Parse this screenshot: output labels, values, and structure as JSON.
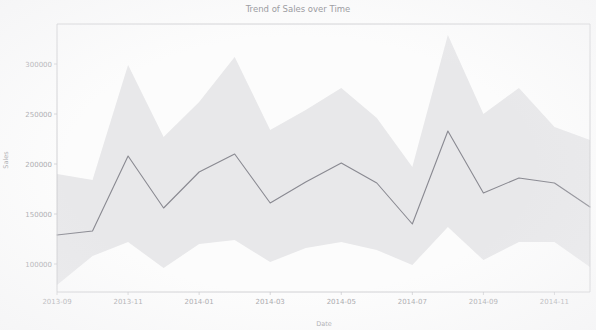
{
  "chart_data": {
    "type": "line",
    "title": "Trend of Sales over Time",
    "xlabel": "Date",
    "ylabel": "Sales",
    "grid": false,
    "legend": null,
    "x_tick_labels": [
      "2013-09",
      "2013-11",
      "2014-01",
      "2014-03",
      "2014-05",
      "2014-07",
      "2014-09",
      "2014-11"
    ],
    "y_tick_labels": [
      "100000",
      "150000",
      "200000",
      "250000",
      "300000"
    ],
    "y_ticks": [
      100000,
      150000,
      200000,
      250000,
      300000
    ],
    "ylim": [
      72000,
      340000
    ],
    "xlim": [
      "2013-09",
      "2014-12"
    ],
    "x": [
      "2013-09",
      "2013-10",
      "2013-11",
      "2013-12",
      "2014-01",
      "2014-02",
      "2014-03",
      "2014-04",
      "2014-05",
      "2014-06",
      "2014-07",
      "2014-08",
      "2014-09",
      "2014-10",
      "2014-11",
      "2014-12"
    ],
    "series": [
      {
        "name": "Sales",
        "values": [
          129000,
          133000,
          208000,
          156000,
          192000,
          210000,
          161000,
          182000,
          201000,
          181000,
          140000,
          233000,
          171000,
          186000,
          181000,
          157000
        ],
        "ci_lower": [
          79000,
          108000,
          122000,
          96000,
          120000,
          124000,
          102000,
          116000,
          122000,
          114000,
          99000,
          137000,
          104000,
          122000,
          122000,
          97000
        ],
        "ci_upper": [
          190000,
          184000,
          299000,
          227000,
          262000,
          307000,
          234000,
          254000,
          276000,
          246000,
          197000,
          329000,
          250000,
          276000,
          237000,
          224000
        ],
        "color": "#8b8b93",
        "ci_color": "#d8d8dc"
      }
    ],
    "annotations": []
  },
  "figure": {
    "plot_area": {
      "left": 57,
      "top": 24,
      "right": 590,
      "bottom": 292
    },
    "title_text": "Trend of Sales over Time"
  }
}
